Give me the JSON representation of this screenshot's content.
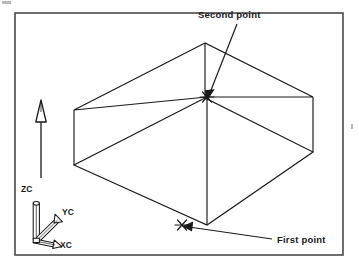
{
  "figure": {
    "kind": "isometric-wireframe-block-diagram",
    "background_color": "#ffffff",
    "line_color": "#1a1a1a",
    "frame": {
      "name": "figure-border",
      "x": 15,
      "y": 13,
      "width": 328,
      "height": 242,
      "stroke_color": "#4a4a4a",
      "stroke_width": 1.6
    }
  },
  "annotations": {
    "second_point": {
      "label": "Second point",
      "text_x": 198,
      "text_y": 18,
      "leader": {
        "from_x": 237,
        "from_y": 24,
        "to_x": 208,
        "to_y": 97
      }
    },
    "first_point": {
      "label": "First point",
      "text_x": 277,
      "text_y": 243,
      "leader": {
        "from_x": 272,
        "from_y": 239,
        "to_x": 184,
        "to_y": 226
      }
    }
  },
  "point_markers": [
    {
      "name": "second-point-marker",
      "glyph": "asterisk",
      "x": 207,
      "y": 97
    },
    {
      "name": "first-point-marker",
      "glyph": "asterisk",
      "x": 182,
      "y": 225
    }
  ],
  "block": {
    "description": "transparent isometric rectangular block, all twelve edges drawn",
    "vertices": {
      "top_back": {
        "x": 205,
        "y": 43
      },
      "top_left": {
        "x": 74,
        "y": 110
      },
      "top_front": {
        "x": 207,
        "y": 97
      },
      "top_right": {
        "x": 313,
        "y": 97
      },
      "bottom_back": {
        "x": 205,
        "y": 98
      },
      "bottom_left": {
        "x": 74,
        "y": 165
      },
      "bottom_front": {
        "x": 207,
        "y": 225
      },
      "bottom_right": {
        "x": 313,
        "y": 152
      }
    }
  },
  "view_arrow": {
    "name": "view-direction-arrow",
    "description": "hollow tapered arrowhead on a thin vertical shaft, pointing up",
    "tip_x": 41,
    "tip_y": 100,
    "tail_x": 41,
    "tail_y": 178
  },
  "axis_triad": {
    "name": "wcs-coordinate-triad",
    "origin": {
      "x": 37,
      "y": 238
    },
    "axes": [
      {
        "name": "zc-axis",
        "label": "ZC",
        "label_x": 21,
        "label_y": 192,
        "direction": "up",
        "end_x": 37,
        "end_y": 200
      },
      {
        "name": "yc-axis",
        "label": "YC",
        "label_x": 62,
        "label_y": 215,
        "direction": "upper-right",
        "end_x": 60,
        "end_y": 214
      },
      {
        "name": "xc-axis",
        "label": "XC",
        "label_x": 60,
        "label_y": 248,
        "direction": "lower-right",
        "end_x": 57,
        "end_y": 245
      }
    ]
  },
  "scan_artifacts": [
    {
      "name": "scan-speck-top-left",
      "x": 2,
      "y": 1,
      "width": 9,
      "height": 3
    },
    {
      "name": "scan-speck-right-margin",
      "x": 351,
      "y": 124,
      "width": 2,
      "height": 5
    }
  ]
}
